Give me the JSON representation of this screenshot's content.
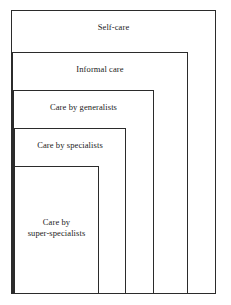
{
  "diagram": {
    "background_color": "#ffffff",
    "line_color": "#2b2b2b",
    "text_color": "#1a1a1a",
    "tiers": [
      {
        "label": "Self-care",
        "level": 1,
        "box": {
          "left": 11,
          "top": 10,
          "width": 205,
          "height": 284
        },
        "label_top": 22
      },
      {
        "label": "Informal care",
        "level": 2,
        "box": {
          "left": 12,
          "top": 52,
          "width": 176,
          "height": 242
        },
        "label_top": 64
      },
      {
        "label": "Care by generalists",
        "level": 3,
        "box": {
          "left": 13,
          "top": 90,
          "width": 141,
          "height": 204
        },
        "label_top": 102
      },
      {
        "label": "Care by specialists",
        "level": 4,
        "box": {
          "left": 14,
          "top": 128,
          "width": 112,
          "height": 166
        },
        "label_top": 140
      },
      {
        "label": "Care by\nsuper-specialists",
        "level": 5,
        "box": {
          "left": 14,
          "top": 166,
          "width": 85,
          "height": 128
        },
        "label_top": 217
      }
    ]
  }
}
